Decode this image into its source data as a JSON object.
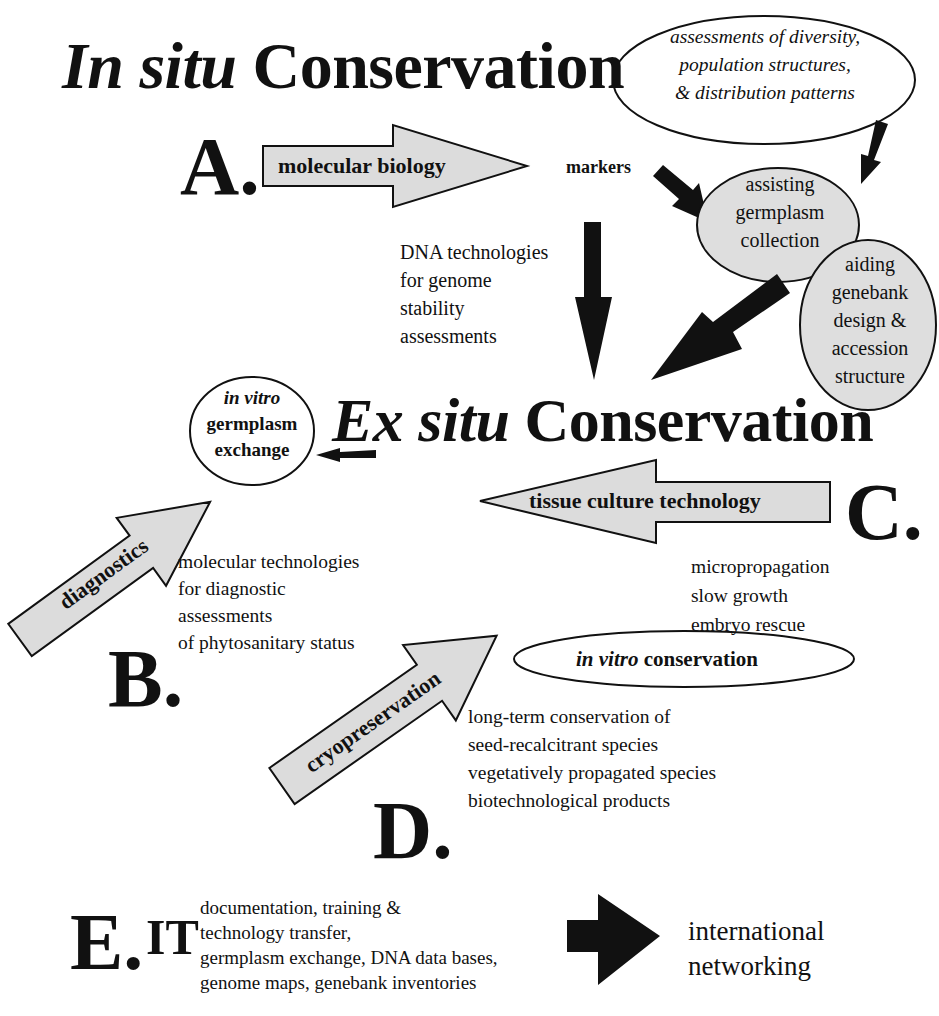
{
  "titles": {
    "in_situ_italic": "In situ",
    "in_situ_rest": "Conservation",
    "ex_situ_italic": "Ex situ",
    "ex_situ_rest": "Conservation"
  },
  "sections": {
    "A": {
      "letter": "A.",
      "arrow_label": "molecular biology",
      "markers_label": "markers",
      "assessment_bubble": [
        "assessments of diversity,",
        "population structures,",
        "& distribution patterns"
      ],
      "collection_bubble": [
        "assisting",
        "germplasm",
        "collection"
      ],
      "genebank_bubble": [
        "aiding",
        "genebank",
        "design &",
        "accession",
        "structure"
      ],
      "dna_text": [
        "DNA technologies",
        "for genome",
        "stability",
        "assessments"
      ]
    },
    "B": {
      "letter": "B.",
      "arrow_label": "diagnostics",
      "exchange_bubble_italic": "in vitro",
      "exchange_bubble": [
        "germplasm",
        "exchange"
      ],
      "text": [
        "molecular technologies",
        "for diagnostic",
        "assessments",
        "of  phytosanitary status"
      ]
    },
    "C": {
      "letter": "C.",
      "arrow_label": "tissue culture technology",
      "text": [
        "micropropagation",
        "slow growth",
        "embryo rescue"
      ],
      "conservation_bubble_italic": "in vitro",
      "conservation_bubble_rest": "conservation"
    },
    "D": {
      "letter": "D.",
      "arrow_label": "cryopreservation",
      "text": [
        "long-term conservation of",
        "seed-recalcitrant species",
        "vegetatively propagated species",
        "biotechnological products"
      ]
    },
    "E": {
      "letter": "E.",
      "it_label": "IT",
      "text": [
        "documentation, training &",
        "technology transfer,",
        "germplasm exchange, DNA data bases,",
        "genome maps, genebank inventories"
      ],
      "target": [
        "international",
        "networking"
      ]
    }
  },
  "colors": {
    "arrow_fill": "#dcdcdc",
    "bubble_fill": "#dedede",
    "ink": "#111111",
    "background": "#ffffff"
  }
}
